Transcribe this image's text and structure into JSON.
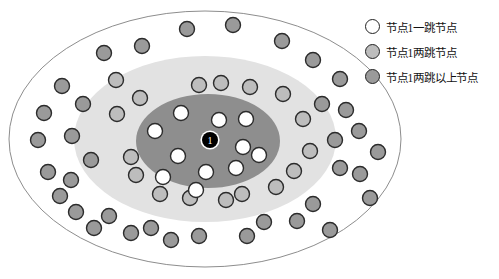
{
  "figure": {
    "title": "",
    "center_node": {
      "label": "1",
      "x": 210,
      "y": 140,
      "r": 8,
      "fill": "#000000",
      "text_color": "#ffffff",
      "name": "node-1-center"
    },
    "ellipses": [
      {
        "name": "outer-ellipse",
        "cx": 205,
        "cy": 139,
        "rx": 196,
        "ry": 128,
        "fill": "#ffffff",
        "stroke": "#8d8d8d",
        "stroke_width": 1
      },
      {
        "name": "middle-ellipse",
        "cx": 205,
        "cy": 139,
        "rx": 131,
        "ry": 83,
        "fill": "#e2e2e2",
        "stroke": "#e2e2e2",
        "stroke_width": 0
      },
      {
        "name": "inner-ellipse",
        "cx": 208,
        "cy": 141,
        "rx": 72,
        "ry": 47,
        "fill": "#8e8e8e",
        "stroke": "#8e8e8e",
        "stroke_width": 0
      }
    ],
    "node_styles": {
      "one_hop": {
        "fill": "#ffffff",
        "stroke": "#2b2b2b",
        "r": 7.5
      },
      "two_hop": {
        "fill": "#bdbdbd",
        "stroke": "#2b2b2b",
        "r": 7.5
      },
      "beyond_two_hop": {
        "fill": "#9a9a9a",
        "stroke": "#2b2b2b",
        "r": 7.5
      }
    },
    "one_hop_nodes": [
      {
        "x": 155,
        "y": 131
      },
      {
        "x": 181,
        "y": 113
      },
      {
        "x": 178,
        "y": 156
      },
      {
        "x": 163,
        "y": 177
      },
      {
        "x": 206,
        "y": 172
      },
      {
        "x": 196,
        "y": 190
      },
      {
        "x": 219,
        "y": 120
      },
      {
        "x": 246,
        "y": 119
      },
      {
        "x": 243,
        "y": 147
      },
      {
        "x": 236,
        "y": 168
      },
      {
        "x": 259,
        "y": 155
      }
    ],
    "two_hop_nodes": [
      {
        "x": 116,
        "y": 80
      },
      {
        "x": 117,
        "y": 114
      },
      {
        "x": 140,
        "y": 98
      },
      {
        "x": 199,
        "y": 85
      },
      {
        "x": 221,
        "y": 83
      },
      {
        "x": 250,
        "y": 87
      },
      {
        "x": 283,
        "y": 94
      },
      {
        "x": 303,
        "y": 119
      },
      {
        "x": 310,
        "y": 151
      },
      {
        "x": 294,
        "y": 171
      },
      {
        "x": 276,
        "y": 187
      },
      {
        "x": 242,
        "y": 194
      },
      {
        "x": 226,
        "y": 200
      },
      {
        "x": 190,
        "y": 198
      },
      {
        "x": 160,
        "y": 194
      },
      {
        "x": 136,
        "y": 175
      },
      {
        "x": 131,
        "y": 157
      }
    ],
    "beyond_two_hop_nodes": [
      {
        "x": 104,
        "y": 53
      },
      {
        "x": 142,
        "y": 46
      },
      {
        "x": 187,
        "y": 29
      },
      {
        "x": 233,
        "y": 25
      },
      {
        "x": 282,
        "y": 41
      },
      {
        "x": 313,
        "y": 60
      },
      {
        "x": 340,
        "y": 79
      },
      {
        "x": 322,
        "y": 104
      },
      {
        "x": 346,
        "y": 110
      },
      {
        "x": 335,
        "y": 140
      },
      {
        "x": 359,
        "y": 131
      },
      {
        "x": 378,
        "y": 152
      },
      {
        "x": 340,
        "y": 168
      },
      {
        "x": 360,
        "y": 174
      },
      {
        "x": 313,
        "y": 204
      },
      {
        "x": 297,
        "y": 221
      },
      {
        "x": 330,
        "y": 230
      },
      {
        "x": 264,
        "y": 222
      },
      {
        "x": 247,
        "y": 236
      },
      {
        "x": 199,
        "y": 236
      },
      {
        "x": 171,
        "y": 240
      },
      {
        "x": 151,
        "y": 228
      },
      {
        "x": 131,
        "y": 233
      },
      {
        "x": 109,
        "y": 216
      },
      {
        "x": 94,
        "y": 228
      },
      {
        "x": 76,
        "y": 212
      },
      {
        "x": 60,
        "y": 196
      },
      {
        "x": 48,
        "y": 172
      },
      {
        "x": 71,
        "y": 180
      },
      {
        "x": 38,
        "y": 140
      },
      {
        "x": 72,
        "y": 136
      },
      {
        "x": 44,
        "y": 113
      },
      {
        "x": 83,
        "y": 104
      },
      {
        "x": 62,
        "y": 86
      },
      {
        "x": 91,
        "y": 160
      },
      {
        "x": 370,
        "y": 198
      }
    ]
  },
  "legend": {
    "items": [
      {
        "swatch_fill": "#ffffff",
        "label": "节点1一跳节点",
        "name": "legend-one-hop"
      },
      {
        "swatch_fill": "#bdbdbd",
        "label": "节点1两跳节点",
        "name": "legend-two-hop"
      },
      {
        "swatch_fill": "#9a9a9a",
        "label": "节点1两跳以上节点",
        "name": "legend-beyond-two-hop"
      }
    ]
  }
}
